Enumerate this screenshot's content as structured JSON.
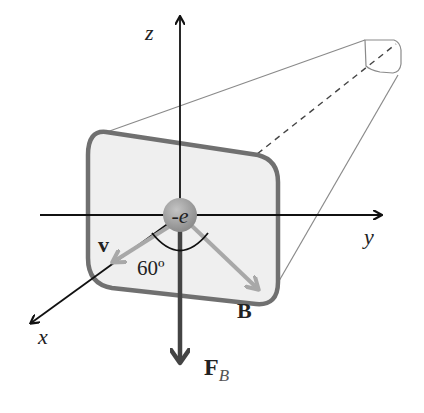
{
  "diagram": {
    "type": "physics-vector-diagram",
    "axes": {
      "z_label": "z",
      "y_label": "y",
      "x_label": "x"
    },
    "charge": {
      "label": "-e",
      "color": "#9a9a9a"
    },
    "vectors": {
      "velocity_label": "v",
      "field_label": "B",
      "force_label": "F",
      "force_subscript": "B"
    },
    "angle_label": "60º",
    "colors": {
      "axis": "#111111",
      "face_fill": "#efefef",
      "face_stroke": "#707070",
      "tube_edge": "#8a8a8a",
      "vector_grey": "#a8a8a8",
      "force_arrow": "#444444"
    }
  }
}
